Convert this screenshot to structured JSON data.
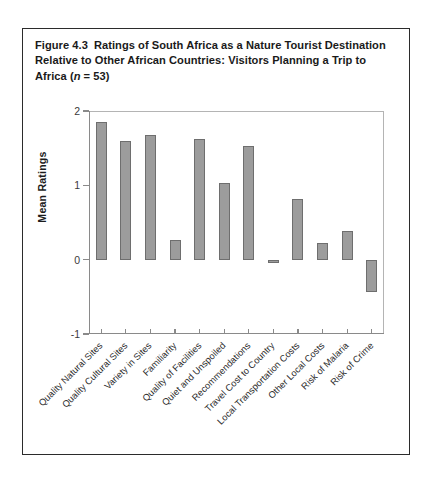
{
  "figure": {
    "number": "Figure 4.3",
    "caption_part1": "Ratings of South Africa as a Nature Tourist Destination Relative to Other African Countries: Visitors Planning a Trip to Africa (",
    "caption_italic": "n",
    "caption_part2": " = 53)"
  },
  "chart_data": {
    "type": "bar",
    "xlabel": "",
    "ylabel": "Mean Ratings",
    "ylim": [
      -1,
      2
    ],
    "yticks": [
      2,
      1,
      0,
      -1
    ],
    "ytick_labels": [
      "2",
      "1",
      "0",
      "-1"
    ],
    "grid": false,
    "legend": null,
    "n": 53,
    "bar_color": "#9c9c9c",
    "bar_edge_color": "#6e6e6e",
    "categories": [
      "Quality Natural Sites",
      "Quality Cultural Sites",
      "Variety in Sites",
      "Familiarity",
      "Quality of Facilities",
      "Quiet and Unspoiled",
      "Recommendations",
      "Travel Cost to Country",
      "Local Transportation Costs",
      "Other Local Costs",
      "Risk of Malaria",
      "Risk of Crime"
    ],
    "values": [
      1.85,
      1.6,
      1.68,
      0.27,
      1.62,
      1.03,
      1.53,
      -0.05,
      0.82,
      0.22,
      0.38,
      -0.43
    ]
  },
  "axis": {
    "y_title": "Mean Ratings",
    "y_tick_2": "2",
    "y_tick_1": "1",
    "y_tick_0": "0",
    "y_tick_neg1": "-1"
  }
}
